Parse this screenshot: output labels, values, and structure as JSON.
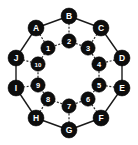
{
  "figure": {
    "kind": "graph-diagram",
    "width": 138,
    "height": 145,
    "background": "#ffffff",
    "node_fill": "#0d0d0d",
    "node_text": "#ffffff",
    "edge_color": "#1a1a1a"
  },
  "graph_data": {
    "type": "node-link-diagram",
    "outer_nodes": [
      {
        "id": "A",
        "label": "A",
        "x": 36,
        "y": 28
      },
      {
        "id": "B",
        "label": "B",
        "x": 69,
        "y": 16
      },
      {
        "id": "C",
        "label": "C",
        "x": 101,
        "y": 28
      },
      {
        "id": "D",
        "label": "D",
        "x": 122,
        "y": 58
      },
      {
        "id": "E",
        "label": "E",
        "x": 122,
        "y": 88
      },
      {
        "id": "F",
        "label": "F",
        "x": 101,
        "y": 118
      },
      {
        "id": "G",
        "label": "G",
        "x": 69,
        "y": 130
      },
      {
        "id": "H",
        "label": "H",
        "x": 36,
        "y": 118
      },
      {
        "id": "I",
        "label": "I",
        "x": 16,
        "y": 88
      },
      {
        "id": "J",
        "label": "J",
        "x": 16,
        "y": 58
      }
    ],
    "inner_nodes": [
      {
        "id": "1",
        "label": "1",
        "x": 48,
        "y": 48
      },
      {
        "id": "2",
        "label": "2",
        "x": 69,
        "y": 41
      },
      {
        "id": "3",
        "label": "3",
        "x": 88,
        "y": 48
      },
      {
        "id": "4",
        "label": "4",
        "x": 99,
        "y": 64
      },
      {
        "id": "5",
        "label": "5",
        "x": 99,
        "y": 85
      },
      {
        "id": "6",
        "label": "6",
        "x": 88,
        "y": 99
      },
      {
        "id": "7",
        "label": "7",
        "x": 69,
        "y": 106
      },
      {
        "id": "8",
        "label": "8",
        "x": 48,
        "y": 99
      },
      {
        "id": "9",
        "label": "9",
        "x": 38,
        "y": 85
      },
      {
        "id": "10",
        "label": "10",
        "x": 38,
        "y": 64
      }
    ],
    "outer_edges": [
      [
        "A",
        "B"
      ],
      [
        "B",
        "C"
      ],
      [
        "C",
        "D"
      ],
      [
        "D",
        "E"
      ],
      [
        "E",
        "F"
      ],
      [
        "F",
        "G"
      ],
      [
        "G",
        "H"
      ],
      [
        "H",
        "I"
      ],
      [
        "I",
        "J"
      ],
      [
        "J",
        "A"
      ]
    ],
    "spoke_edges": [
      [
        "A",
        "1"
      ],
      [
        "B",
        "2"
      ],
      [
        "C",
        "3"
      ],
      [
        "D",
        "4"
      ],
      [
        "E",
        "5"
      ],
      [
        "F",
        "6"
      ],
      [
        "G",
        "7"
      ],
      [
        "H",
        "8"
      ],
      [
        "I",
        "9"
      ],
      [
        "J",
        "10"
      ]
    ],
    "inner_edges": [
      [
        "1",
        "2"
      ],
      [
        "2",
        "3"
      ],
      [
        "3",
        "4"
      ],
      [
        "4",
        "5"
      ],
      [
        "5",
        "6"
      ],
      [
        "6",
        "7"
      ],
      [
        "7",
        "8"
      ],
      [
        "8",
        "9"
      ],
      [
        "9",
        "10"
      ],
      [
        "10",
        "1"
      ]
    ],
    "node_radius_outer": 8,
    "node_radius_inner": 7.2,
    "outer_edge_style": "solid",
    "spoke_edge_style": "dashed",
    "inner_edge_style": "dashed"
  }
}
